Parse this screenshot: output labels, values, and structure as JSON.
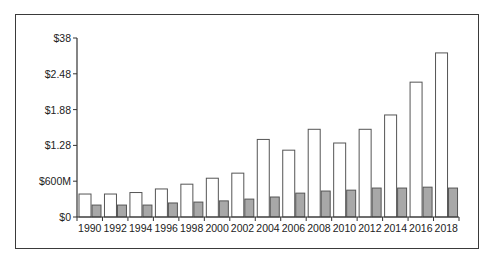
{
  "chart_data": {
    "type": "bar",
    "title": "",
    "xlabel": "",
    "ylabel": "",
    "ylim": [
      0,
      3000000000
    ],
    "y_ticks": [
      {
        "value": 0,
        "label": "$0"
      },
      {
        "value": 600000000,
        "label": "$600M"
      },
      {
        "value": 1200000000,
        "label": "$1.28"
      },
      {
        "value": 1800000000,
        "label": "$1.88"
      },
      {
        "value": 2400000000,
        "label": "$2.48"
      },
      {
        "value": 3000000000,
        "label": "$38"
      }
    ],
    "categories": [
      "1990",
      "1992",
      "1994",
      "1996",
      "1998",
      "2000",
      "2002",
      "2004",
      "2006",
      "2008",
      "2010",
      "2012",
      "2014",
      "2016",
      "2018"
    ],
    "series": [
      {
        "name": "Series 1 (white)",
        "color": "#ffffff",
        "border": "#555555",
        "values": [
          385000000,
          385000000,
          410000000,
          470000000,
          550000000,
          650000000,
          735000000,
          1300000000,
          1120000000,
          1470000000,
          1240000000,
          1470000000,
          1710000000,
          2260000000,
          2750000000
        ]
      },
      {
        "name": "Series 2 (gray)",
        "color": "#a8a8a8",
        "border": "#555555",
        "values": [
          200000000,
          200000000,
          200000000,
          235000000,
          250000000,
          270000000,
          300000000,
          335000000,
          400000000,
          435000000,
          450000000,
          485000000,
          485000000,
          500000000,
          485000000
        ]
      }
    ],
    "grid": false,
    "legend": null
  }
}
